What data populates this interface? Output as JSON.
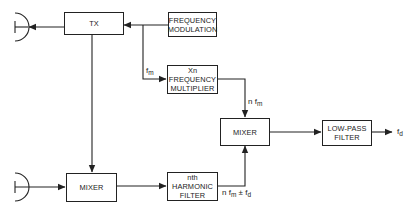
{
  "diagram": {
    "blocks": {
      "tx": {
        "lines": [
          "TX"
        ]
      },
      "freq_mod": {
        "lines": [
          "FREQUENCY",
          "MODULATION"
        ]
      },
      "multiplier": {
        "lines": [
          "Xn",
          "FREQUENCY",
          "MULTIPLIER"
        ]
      },
      "mixer_top": {
        "lines": [
          "MIXER"
        ]
      },
      "low_pass": {
        "lines": [
          "LOW-PASS",
          "FILTER"
        ]
      },
      "mixer_bottom": {
        "lines": [
          "MIXER"
        ]
      },
      "harmonic": {
        "lines": [
          "nth",
          "HARMONIC",
          "FILTER"
        ]
      }
    },
    "labels": {
      "fm": {
        "main": "f",
        "sub": "m"
      },
      "nfm": {
        "main": "n f",
        "sub": "m"
      },
      "nfm_fd": {
        "main": "n f",
        "sub": "m",
        "tail": "± f",
        "tail_sub": "d"
      },
      "fd_out": {
        "main": "f",
        "sub": "d"
      }
    },
    "antennas": [
      "transmit-antenna",
      "receive-antenna"
    ],
    "line_color": "#222222"
  }
}
